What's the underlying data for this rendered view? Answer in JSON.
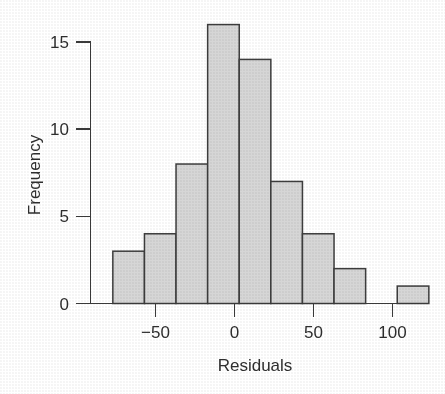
{
  "chart_data": {
    "type": "bar",
    "subtype": "histogram",
    "title": "",
    "xlabel": "Residuals",
    "ylabel": "Frequency",
    "xlim": [
      -77,
      120
    ],
    "ylim": [
      0,
      16
    ],
    "grid": false,
    "legend": null,
    "bin_width": 20,
    "bin_edges": [
      -77,
      -57,
      -37,
      -17,
      3,
      23,
      43,
      63,
      83,
      103,
      123
    ],
    "categories": [
      "-77 to -57",
      "-57 to -37",
      "-37 to -17",
      "-17 to 3",
      "3 to 23",
      "23 to 43",
      "43 to 63",
      "63 to 83",
      "83 to 103",
      "103 to 123"
    ],
    "values": [
      3,
      4,
      8,
      16,
      14,
      7,
      4,
      2,
      0,
      1
    ],
    "xticks": [
      -50,
      0,
      50,
      100
    ],
    "xtick_labels": [
      "−50",
      "0",
      "50",
      "100"
    ],
    "yticks": [
      0,
      5,
      10,
      15
    ],
    "ytick_labels": [
      "0",
      "5",
      "10",
      "15"
    ],
    "colors": {
      "bar_fill": "#d6d6d6",
      "bar_stroke": "#3d3d3d",
      "axis": "#3a3a3a",
      "text": "#2e2e2e",
      "background": "#ffffff"
    }
  },
  "axes": {
    "x_title": "Residuals",
    "y_title": "Frequency"
  }
}
